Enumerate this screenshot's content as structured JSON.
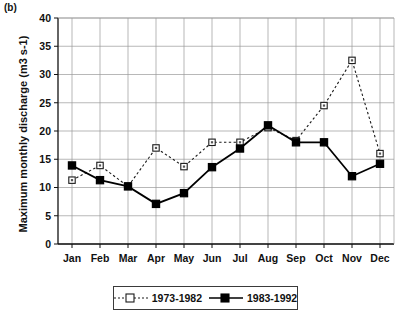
{
  "panel": {
    "label": "(b)"
  },
  "chart_data": {
    "type": "line",
    "title": "",
    "xlabel": "",
    "ylabel": "Maximum monthly discharge (m3 s-1)",
    "categories": [
      "Jan",
      "Feb",
      "Mar",
      "Apr",
      "May",
      "Jun",
      "Jul",
      "Aug",
      "Sep",
      "Oct",
      "Nov",
      "Dec"
    ],
    "ylim": [
      0,
      40
    ],
    "yticks": [
      0,
      5,
      10,
      15,
      20,
      25,
      30,
      35,
      40
    ],
    "grid": true,
    "legend_position": "bottom",
    "series": [
      {
        "name": "1973-1982",
        "marker": "open-square",
        "line_style": "dotted",
        "color": "#1a1a1a",
        "values": [
          11.3,
          13.9,
          10.2,
          17.0,
          13.7,
          18.0,
          18.0,
          20.6,
          18.3,
          24.5,
          32.5,
          16.0
        ]
      },
      {
        "name": "1983-1992",
        "marker": "filled-square",
        "line_style": "solid",
        "color": "#000000",
        "values": [
          13.9,
          11.3,
          10.2,
          7.1,
          9.0,
          13.6,
          16.9,
          21.0,
          18.0,
          18.0,
          12.0,
          14.2
        ]
      }
    ]
  },
  "legend": {
    "items": [
      {
        "label": "1973-1982"
      },
      {
        "label": "1983-1992"
      }
    ]
  }
}
